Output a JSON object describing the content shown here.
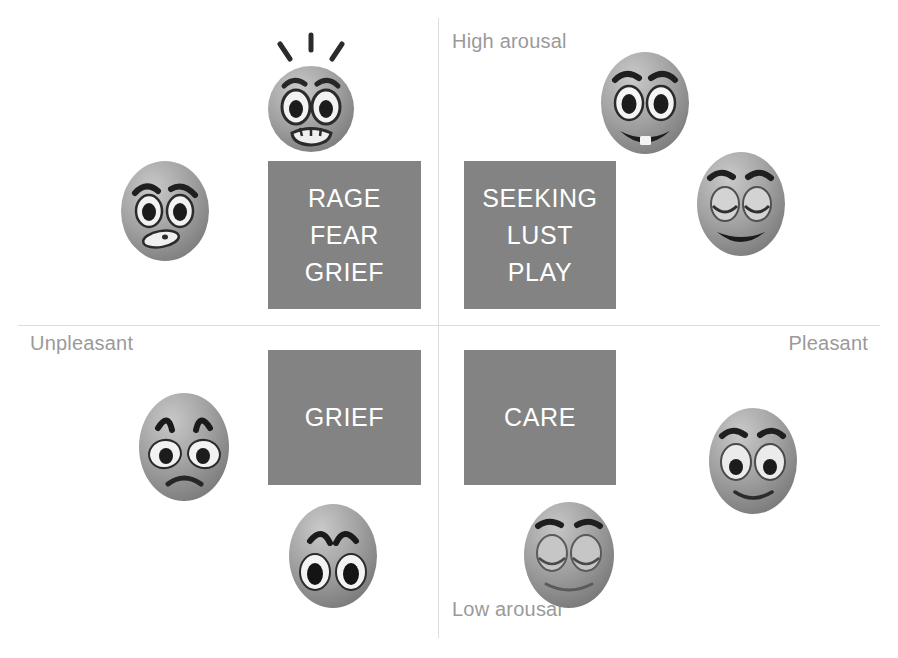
{
  "diagram": {
    "type": "2x2-quadrant-circumplex",
    "background_color": "#ffffff",
    "box_color": "#838383",
    "box_text_color": "#ffffff",
    "axis_color": "#dddddd",
    "axis_label_color": "#9a9a9a"
  },
  "axes": {
    "vertical": {
      "name": "arousal",
      "top_label": "High arousal",
      "bottom_label": "Low arousal"
    },
    "horizontal": {
      "name": "valence",
      "left_label": "Unpleasant",
      "right_label": "Pleasant"
    }
  },
  "quadrants": [
    {
      "id": "upper-left",
      "valence": "unpleasant",
      "arousal": "high",
      "lines": [
        "RAGE",
        "FEAR",
        "GRIEF"
      ]
    },
    {
      "id": "upper-right",
      "valence": "pleasant",
      "arousal": "high",
      "lines": [
        "SEEKING",
        "LUST",
        "PLAY"
      ]
    },
    {
      "id": "lower-left",
      "valence": "unpleasant",
      "arousal": "low",
      "lines": [
        "GRIEF"
      ]
    },
    {
      "id": "lower-right",
      "valence": "pleasant",
      "arousal": "low",
      "lines": [
        "CARE"
      ]
    }
  ],
  "faces": [
    {
      "id": "shocked-fear",
      "icon": "face-shocked-icon",
      "description": "shocked fearful face with shock lines",
      "quadrant": "upper-left"
    },
    {
      "id": "angry",
      "icon": "face-angry-icon",
      "description": "angry scowling face",
      "quadrant": "upper-left"
    },
    {
      "id": "excited-grin",
      "icon": "face-excited-icon",
      "description": "excited grinning face with teeth",
      "quadrant": "upper-right"
    },
    {
      "id": "laughing",
      "icon": "face-laughing-icon",
      "description": "laughing face with closed arc eyes",
      "quadrant": "upper-right"
    },
    {
      "id": "crying-sad",
      "icon": "face-crying-icon",
      "description": "sad crying face with frown",
      "quadrant": "lower-left"
    },
    {
      "id": "worried-sad",
      "icon": "face-worried-icon",
      "description": "worried sad face with raised brows",
      "quadrant": "lower-left"
    },
    {
      "id": "calm-sleepy",
      "icon": "face-calm-icon",
      "description": "calm face with closed eyes",
      "quadrant": "lower-right"
    },
    {
      "id": "content-smile",
      "icon": "face-content-icon",
      "description": "content gently smiling face",
      "quadrant": "lower-right"
    }
  ]
}
